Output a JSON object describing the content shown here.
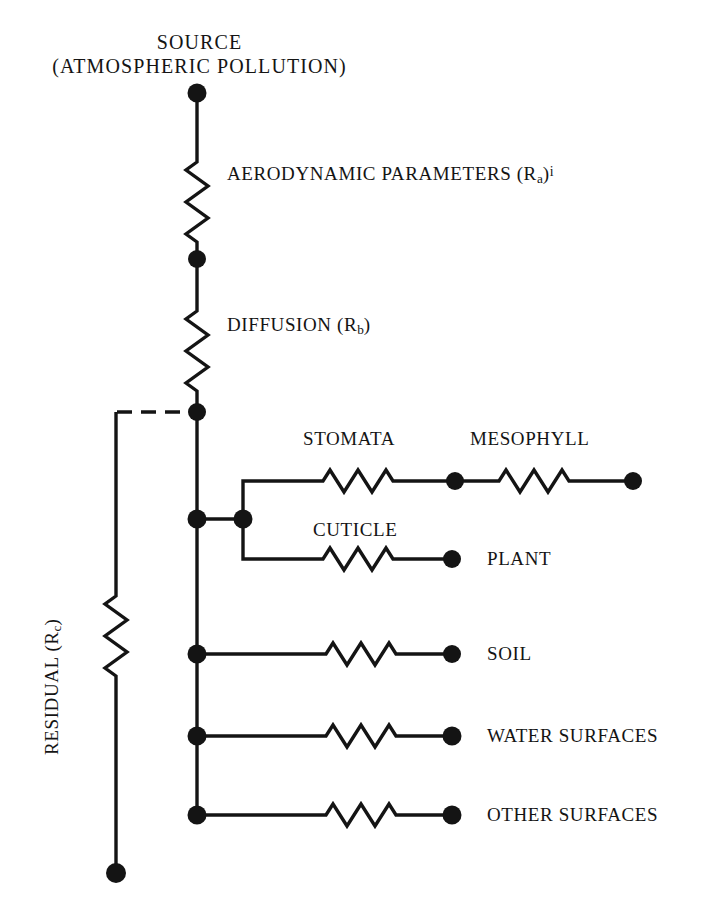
{
  "figure": {
    "type": "resistance-network-diagram",
    "title_line1": "SOURCE",
    "title_line2": "(ATMOSPHERIC POLLUTION)",
    "stroke_color": "#141414",
    "background_color": "#ffffff"
  },
  "parameters": [
    {
      "id": "aerodynamic",
      "text_main": "AERODYNAMIC PARAMETERS (R",
      "subscript": "a",
      "text_tail": ")",
      "superscript": "i"
    },
    {
      "id": "diffusion",
      "text_main": "DIFFUSION (R",
      "subscript": "b",
      "text_tail": ")",
      "superscript": ""
    },
    {
      "id": "residual",
      "text_main": "RESIDUAL (R",
      "subscript": "c",
      "text_tail": ")",
      "superscript": ""
    }
  ],
  "branches": [
    {
      "id": "stomata",
      "label": "STOMATA"
    },
    {
      "id": "mesophyll",
      "label": "MESOPHYLL"
    },
    {
      "id": "cuticle",
      "label": "CUTICLE"
    },
    {
      "id": "plant",
      "label": "PLANT"
    },
    {
      "id": "soil",
      "label": "SOIL"
    },
    {
      "id": "water-surfaces",
      "label": "WATER SURFACES"
    },
    {
      "id": "other-surfaces",
      "label": "OTHER SURFACES"
    }
  ]
}
